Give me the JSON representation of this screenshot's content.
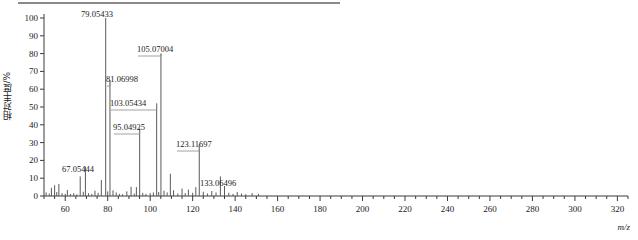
{
  "figure": {
    "y_axis_title": "相对丰度/%",
    "x_axis_title": "m/z",
    "top_rule_color": "#8a8a8a",
    "axis_color": "#3a3a3a",
    "peak_color": "#5a5a5a",
    "label_color": "#1a1a1a"
  },
  "chart_data": {
    "type": "bar",
    "title": "",
    "subtitle": "",
    "xlabel": "m/z",
    "ylabel": "相对丰度/%",
    "xlim": [
      50,
      325
    ],
    "ylim": [
      0,
      100
    ],
    "grid": false,
    "legend": null,
    "x_ticks": [
      60,
      80,
      100,
      120,
      140,
      160,
      180,
      200,
      220,
      240,
      260,
      280,
      300,
      320
    ],
    "x_minor_tick_step": 5,
    "y_ticks": [
      0,
      10,
      20,
      30,
      40,
      50,
      60,
      70,
      80,
      90,
      100
    ],
    "annotations": [
      {
        "mz": 67.05444,
        "label": "67.05444",
        "intensity": 11
      },
      {
        "mz": 79.05433,
        "label": "79.05433",
        "intensity": 100
      },
      {
        "mz": 81.06998,
        "label": "81.06998",
        "intensity": 65
      },
      {
        "mz": 95.04925,
        "label": "95.04925",
        "intensity": 38
      },
      {
        "mz": 103.05434,
        "label": "103.05434",
        "intensity": 52
      },
      {
        "mz": 105.07004,
        "label": "105.07004",
        "intensity": 80
      },
      {
        "mz": 123.11697,
        "label": "123.11697",
        "intensity": 29
      },
      {
        "mz": 133.06496,
        "label": "133.06496",
        "intensity": 11
      }
    ],
    "peaks": [
      {
        "mz": 51.0,
        "intensity": 2.0
      },
      {
        "mz": 52.5,
        "intensity": 1.4
      },
      {
        "mz": 53.5,
        "intensity": 4.6
      },
      {
        "mz": 55.0,
        "intensity": 6.0
      },
      {
        "mz": 56.0,
        "intensity": 2.2
      },
      {
        "mz": 57.0,
        "intensity": 6.8
      },
      {
        "mz": 58.5,
        "intensity": 1.6
      },
      {
        "mz": 60.0,
        "intensity": 1.2
      },
      {
        "mz": 61.0,
        "intensity": 3.4
      },
      {
        "mz": 62.5,
        "intensity": 1.1
      },
      {
        "mz": 64.0,
        "intensity": 1.6
      },
      {
        "mz": 65.5,
        "intensity": 1.0
      },
      {
        "mz": 67.05444,
        "intensity": 11.0
      },
      {
        "mz": 68.5,
        "intensity": 2.4
      },
      {
        "mz": 69.5,
        "intensity": 16.5
      },
      {
        "mz": 71.0,
        "intensity": 1.6
      },
      {
        "mz": 72.5,
        "intensity": 1.2
      },
      {
        "mz": 74.0,
        "intensity": 3.0
      },
      {
        "mz": 75.5,
        "intensity": 1.8
      },
      {
        "mz": 77.0,
        "intensity": 9.0
      },
      {
        "mz": 79.05433,
        "intensity": 100.0
      },
      {
        "mz": 80.0,
        "intensity": 2.6
      },
      {
        "mz": 81.06998,
        "intensity": 65.0
      },
      {
        "mz": 82.5,
        "intensity": 3.2
      },
      {
        "mz": 84.0,
        "intensity": 2.0
      },
      {
        "mz": 85.5,
        "intensity": 1.2
      },
      {
        "mz": 87.0,
        "intensity": 1.0
      },
      {
        "mz": 89.0,
        "intensity": 2.6
      },
      {
        "mz": 91.0,
        "intensity": 5.2
      },
      {
        "mz": 92.5,
        "intensity": 1.4
      },
      {
        "mz": 93.5,
        "intensity": 5.0
      },
      {
        "mz": 95.04925,
        "intensity": 38.0
      },
      {
        "mz": 96.5,
        "intensity": 1.8
      },
      {
        "mz": 98.0,
        "intensity": 1.2
      },
      {
        "mz": 100.0,
        "intensity": 1.6
      },
      {
        "mz": 101.5,
        "intensity": 2.0
      },
      {
        "mz": 103.05434,
        "intensity": 52.0
      },
      {
        "mz": 104.0,
        "intensity": 2.2
      },
      {
        "mz": 105.07004,
        "intensity": 80.0
      },
      {
        "mz": 106.5,
        "intensity": 3.0
      },
      {
        "mz": 108.0,
        "intensity": 2.0
      },
      {
        "mz": 109.5,
        "intensity": 12.5
      },
      {
        "mz": 111.0,
        "intensity": 3.2
      },
      {
        "mz": 113.0,
        "intensity": 1.4
      },
      {
        "mz": 115.0,
        "intensity": 4.2
      },
      {
        "mz": 116.5,
        "intensity": 1.6
      },
      {
        "mz": 118.0,
        "intensity": 3.6
      },
      {
        "mz": 120.0,
        "intensity": 1.8
      },
      {
        "mz": 121.5,
        "intensity": 5.0
      },
      {
        "mz": 123.11697,
        "intensity": 29.0
      },
      {
        "mz": 125.0,
        "intensity": 2.4
      },
      {
        "mz": 127.0,
        "intensity": 1.4
      },
      {
        "mz": 129.0,
        "intensity": 2.8
      },
      {
        "mz": 131.0,
        "intensity": 2.0
      },
      {
        "mz": 133.06496,
        "intensity": 11.0
      },
      {
        "mz": 135.0,
        "intensity": 5.6
      },
      {
        "mz": 137.0,
        "intensity": 1.8
      },
      {
        "mz": 139.0,
        "intensity": 1.2
      },
      {
        "mz": 141.0,
        "intensity": 2.2
      },
      {
        "mz": 143.0,
        "intensity": 1.4
      },
      {
        "mz": 145.0,
        "intensity": 1.0
      },
      {
        "mz": 148.0,
        "intensity": 1.6
      },
      {
        "mz": 151.0,
        "intensity": 1.1
      }
    ]
  }
}
